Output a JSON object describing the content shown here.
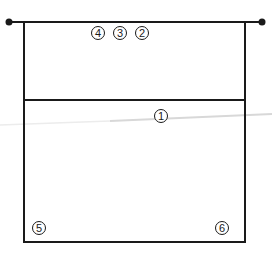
{
  "diagram": {
    "type": "volleyball-court-positions",
    "colors": {
      "line": "#1a1a1a",
      "faint_line": "#d8d8d8",
      "background": "#ffffff"
    },
    "net": {
      "y": 22,
      "x1": 9,
      "x2": 262,
      "endpoints": "filled-dots"
    },
    "court": {
      "left": 24,
      "right": 245,
      "top": 22,
      "bottom": 242,
      "attack_line_y": 100
    },
    "positions": [
      {
        "label": "4",
        "x": 98,
        "y": 33
      },
      {
        "label": "3",
        "x": 120,
        "y": 33
      },
      {
        "label": "2",
        "x": 142,
        "y": 33
      },
      {
        "label": "1",
        "x": 161,
        "y": 116
      },
      {
        "label": "5",
        "x": 39,
        "y": 228
      },
      {
        "label": "6",
        "x": 222,
        "y": 228
      }
    ]
  }
}
